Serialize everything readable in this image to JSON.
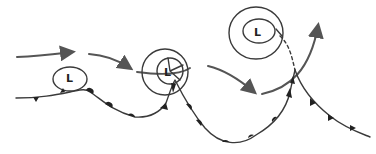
{
  "diagram": {
    "type": "weather-fronts-cyclone-sequence",
    "colors": {
      "ink": "#3a3a3a",
      "arrow": "#555555",
      "symbol": "#222222",
      "background": "#ffffff"
    },
    "lows": [
      {
        "label": "L",
        "stage": "wave"
      },
      {
        "label": "L",
        "stage": "mature"
      },
      {
        "label": "L",
        "stage": "occluded"
      }
    ]
  }
}
